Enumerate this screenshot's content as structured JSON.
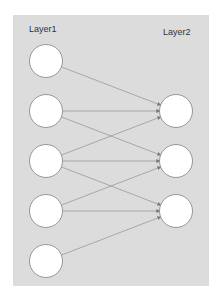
{
  "diagram": {
    "layer1_label": "Layer1",
    "layer2_label": "Layer2",
    "layer1_nodes": [
      {
        "id": "l1n1",
        "cx": 46,
        "cy": 61
      },
      {
        "id": "l1n2",
        "cx": 46,
        "cy": 111
      },
      {
        "id": "l1n3",
        "cx": 46,
        "cy": 161
      },
      {
        "id": "l1n4",
        "cx": 46,
        "cy": 211
      },
      {
        "id": "l1n5",
        "cx": 46,
        "cy": 261
      }
    ],
    "layer2_nodes": [
      {
        "id": "l2n1",
        "cx": 176,
        "cy": 111
      },
      {
        "id": "l2n2",
        "cx": 176,
        "cy": 161
      },
      {
        "id": "l2n3",
        "cx": 176,
        "cy": 211
      }
    ],
    "edges": [
      [
        "l1n1",
        "l2n1"
      ],
      [
        "l1n2",
        "l2n1"
      ],
      [
        "l1n2",
        "l2n2"
      ],
      [
        "l1n3",
        "l2n1"
      ],
      [
        "l1n3",
        "l2n2"
      ],
      [
        "l1n3",
        "l2n3"
      ],
      [
        "l1n4",
        "l2n2"
      ],
      [
        "l1n4",
        "l2n3"
      ],
      [
        "l1n5",
        "l2n3"
      ]
    ],
    "colors": {
      "panel": "#dcdcdc",
      "edge": "#999999",
      "node_fill": "#ffffff",
      "node_stroke": "#8c8c8c"
    }
  }
}
